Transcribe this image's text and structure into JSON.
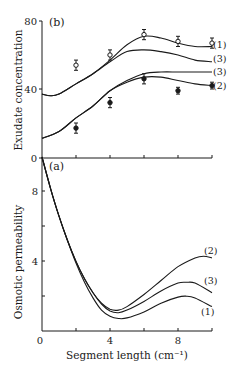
{
  "chart_data": [
    {
      "panel": "(b)",
      "type": "line",
      "title": "",
      "xlabel": "Segment length (cm⁻¹)",
      "ylabel": "Exudate concentration",
      "xlim": [
        0,
        10
      ],
      "ylim": [
        0,
        80
      ],
      "xticks": [
        0,
        2,
        4,
        6,
        8,
        10
      ],
      "yticks": [
        0,
        40,
        80
      ],
      "ytick_labels": [
        "0",
        "40",
        "80"
      ],
      "grid": false,
      "series": [
        {
          "name": "(1)",
          "kind": "curve",
          "x": [
            0,
            0.5,
            1,
            2,
            3,
            4,
            5,
            6,
            7,
            8,
            9,
            10
          ],
          "values": [
            37,
            36,
            37,
            43,
            49,
            57,
            66,
            71,
            70,
            67,
            65,
            65
          ]
        },
        {
          "name": "(3)",
          "kind": "curve",
          "x": [
            0,
            0.5,
            1,
            2,
            3,
            4,
            5,
            6,
            7,
            8,
            9,
            10
          ],
          "values": [
            37,
            36,
            37,
            43,
            49,
            56,
            62,
            63,
            62,
            60,
            57,
            56
          ]
        },
        {
          "name": "(3)",
          "kind": "curve",
          "x": [
            0,
            1,
            2,
            3,
            4,
            5,
            6,
            7,
            8,
            9,
            10
          ],
          "values": [
            11,
            15,
            23,
            30,
            39,
            45,
            49,
            50,
            50,
            50,
            50
          ]
        },
        {
          "name": "(2)",
          "kind": "curve",
          "x": [
            0,
            1,
            2,
            3,
            4,
            5,
            6,
            7,
            8,
            9,
            10
          ],
          "values": [
            11,
            15,
            23,
            30,
            39,
            44,
            47,
            47,
            45,
            43,
            42
          ]
        },
        {
          "name": "open-markers",
          "kind": "points",
          "marker": "open-circle",
          "x": [
            2,
            4,
            6,
            8,
            10
          ],
          "values": [
            54,
            60,
            72,
            68,
            67
          ],
          "error": [
            3,
            3,
            3,
            3,
            3
          ]
        },
        {
          "name": "filled-markers",
          "kind": "points",
          "marker": "filled-circle",
          "x": [
            2,
            4,
            6,
            8,
            10
          ],
          "values": [
            17,
            32,
            46,
            39,
            42
          ],
          "error": [
            3,
            3,
            3,
            2,
            2
          ]
        }
      ],
      "annotations": [
        "(b)",
        "(1)",
        "(3)",
        "(3)",
        "(2)"
      ]
    },
    {
      "panel": "(a)",
      "type": "line",
      "title": "",
      "xlabel": "Segment length (cm⁻¹)",
      "ylabel": "Osmotic permeability",
      "xlim": [
        0,
        10
      ],
      "ylim": [
        0,
        10
      ],
      "xticks": [
        0,
        2,
        4,
        6,
        8,
        10
      ],
      "xtick_labels": [
        "0",
        "",
        "4",
        "",
        "8",
        ""
      ],
      "yticks": [
        0,
        2,
        4,
        6,
        8
      ],
      "ytick_labels": [
        "",
        "",
        "4",
        "",
        "8"
      ],
      "grid": false,
      "series": [
        {
          "name": "(2)",
          "x": [
            0,
            0.5,
            1,
            1.5,
            2,
            2.5,
            3,
            3.5,
            4,
            4.5,
            5,
            6,
            7,
            8,
            9,
            9.5,
            10
          ],
          "values": [
            10,
            8.2,
            6.6,
            5.2,
            4.0,
            3.0,
            2.2,
            1.6,
            1.25,
            1.2,
            1.4,
            2.1,
            2.9,
            3.7,
            4.2,
            4.3,
            4.2
          ]
        },
        {
          "name": "(3)",
          "x": [
            0,
            0.5,
            1,
            1.5,
            2,
            2.5,
            3,
            3.5,
            4,
            4.5,
            5,
            6,
            7,
            8,
            8.5,
            9,
            10
          ],
          "values": [
            10,
            8.2,
            6.6,
            5.2,
            4.0,
            3.0,
            2.2,
            1.55,
            1.15,
            1.05,
            1.2,
            1.7,
            2.3,
            2.75,
            2.8,
            2.75,
            2.2
          ]
        },
        {
          "name": "(1)",
          "x": [
            0,
            0.5,
            1,
            1.5,
            2,
            2.5,
            3,
            3.5,
            4,
            4.5,
            5,
            6,
            7,
            8,
            8.5,
            9,
            10
          ],
          "values": [
            10,
            8.2,
            6.6,
            5.2,
            3.9,
            2.8,
            1.9,
            1.2,
            0.85,
            0.72,
            0.75,
            1.1,
            1.6,
            1.95,
            2.0,
            1.9,
            1.4
          ]
        }
      ],
      "annotations": [
        "(a)",
        "(2)",
        "(3)",
        "(1)"
      ]
    }
  ],
  "labels": {
    "panel_b": "(b)",
    "panel_a": "(a)",
    "ylabel_b": "Exudate concentration",
    "ylabel_a": "Osmotic permeability",
    "xlabel": "Segment length (cm⁻¹)",
    "b_tick_80": "80",
    "b_tick_40": "40",
    "b_tick_0": "0",
    "a_tick_8": "8",
    "a_tick_4": "4",
    "x_tick_0": "0",
    "x_tick_4": "4",
    "x_tick_8": "8",
    "b_curve_1": "(1)",
    "b_curve_3a": "(3)",
    "b_curve_3b": "(3)",
    "b_curve_2": "(2)",
    "a_curve_2": "(2)",
    "a_curve_3": "(3)",
    "a_curve_1": "(1)"
  }
}
